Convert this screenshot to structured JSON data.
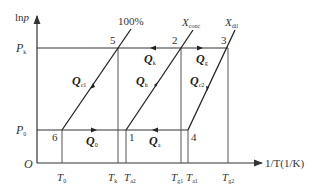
{
  "diagram": {
    "type": "thermodynamic ln p vs 1/T diagram",
    "axes": {
      "y_label": "lnp",
      "x_label": "1/T(1/K)",
      "origin": "O"
    },
    "y_ticks": [
      {
        "base": "P",
        "sub": "k"
      },
      {
        "base": "P",
        "sub": "0"
      }
    ],
    "x_ticks": [
      {
        "base": "T",
        "sub": "0"
      },
      {
        "base": "T",
        "sub": "k"
      },
      {
        "base": "T",
        "sub": "a2"
      },
      {
        "base": "T",
        "sub": "g1"
      },
      {
        "base": "T",
        "sub": "a1"
      },
      {
        "base": "T",
        "sub": "g2"
      }
    ],
    "iso_lines": [
      {
        "label": "100%"
      },
      {
        "base": "X",
        "sub": "conc"
      },
      {
        "base": "X",
        "sub": "dil"
      }
    ],
    "points": [
      "1",
      "2",
      "3",
      "4",
      "5",
      "6"
    ],
    "heat_flows": [
      {
        "base": "Q",
        "sub": "c1"
      },
      {
        "base": "Q",
        "sub": "k"
      },
      {
        "base": "Q",
        "sub": "h"
      },
      {
        "base": "Q",
        "sub": "g"
      },
      {
        "base": "Q",
        "sub": "c2"
      },
      {
        "base": "Q",
        "sub": "0"
      },
      {
        "base": "Q",
        "sub": "a"
      }
    ],
    "line_color": "#333333"
  }
}
